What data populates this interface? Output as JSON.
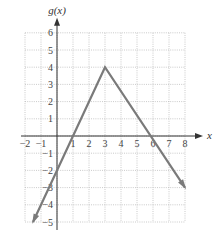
{
  "chart_data": {
    "type": "line",
    "title": "",
    "xlabel": "x",
    "ylabel": "g(x)",
    "xlim": [
      -2,
      8
    ],
    "ylim": [
      -5,
      6
    ],
    "grid": true,
    "grid_style": "dotted",
    "x_ticks": [
      "-2",
      "-1",
      "1",
      "2",
      "3",
      "4",
      "5",
      "6",
      "7",
      "8"
    ],
    "y_ticks": [
      "6",
      "5",
      "4",
      "3",
      "2",
      "1",
      "-1",
      "-2",
      "-3",
      "-4",
      "-5"
    ],
    "series": [
      {
        "name": "g(x)",
        "color": "#7a7a7a",
        "points": [
          [
            -1.5,
            -5
          ],
          [
            3,
            4
          ],
          [
            8,
            -3
          ]
        ],
        "arrows": "both"
      }
    ],
    "key_points": {
      "vertex": [
        3,
        4
      ],
      "y_intercept": [
        0,
        -2
      ],
      "x_intercepts": [
        [
          1,
          0
        ],
        [
          6,
          0
        ]
      ]
    }
  },
  "colors": {
    "grid": "#bdbdbd",
    "axis": "#333333",
    "line": "#7a7a7a"
  }
}
